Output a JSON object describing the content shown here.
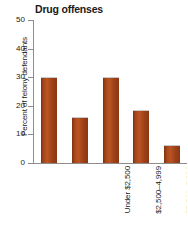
{
  "chart_data": {
    "type": "bar",
    "title": "Drug offenses",
    "xlabel": "",
    "ylabel": "Percent of felony defendants",
    "categories": [
      "Under $2,500",
      "$2,500–4,999",
      "$5,000–9,999",
      "$10,000–19,999",
      "$20,000 or more"
    ],
    "values": [
      30,
      16,
      30,
      18.5,
      6.3
    ],
    "ylim": [
      0,
      50
    ],
    "yticks": [
      0,
      10,
      20,
      30,
      40,
      50
    ],
    "ytick_labels": [
      "0",
      "10",
      "20",
      "30",
      "40",
      "50"
    ],
    "grid": false,
    "legend": false,
    "bar_color": "#9e4119",
    "axis_color": "#8d8d8d"
  }
}
